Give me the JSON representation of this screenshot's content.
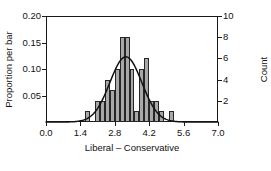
{
  "chart_data": {
    "type": "bar",
    "title": "",
    "subtitle": "",
    "xlabel": "Liberal – Conservative",
    "ylabel": "Proportion per bar",
    "ylabel_right": "Count",
    "xlim": [
      0.0,
      7.0
    ],
    "ylim": [
      0.0,
      0.2
    ],
    "ylim_right": [
      0,
      10
    ],
    "grid": false,
    "legend": null,
    "bin_width": 0.2,
    "n_total": 50,
    "x_ticks": [
      0.0,
      1.4,
      2.8,
      4.2,
      5.6,
      7.0
    ],
    "x_tick_labels": [
      "0.0",
      "1.4",
      "2.8",
      "4.2",
      "5.6",
      "7.0"
    ],
    "y_ticks_left": [
      0.05,
      0.1,
      0.15,
      0.2
    ],
    "y_tick_labels_left": [
      "0.05",
      "0.10",
      "0.15",
      "0.20"
    ],
    "y_ticks_right": [
      2,
      4,
      6,
      8,
      10
    ],
    "y_tick_labels_right": [
      "2",
      "4",
      "6",
      "8",
      "10"
    ],
    "bars": [
      {
        "x0": 1.6,
        "x1": 1.8,
        "count": 1,
        "proportion": 0.02
      },
      {
        "x0": 2.0,
        "x1": 2.2,
        "count": 2,
        "proportion": 0.04
      },
      {
        "x0": 2.2,
        "x1": 2.4,
        "count": 2,
        "proportion": 0.04
      },
      {
        "x0": 2.4,
        "x1": 2.6,
        "count": 4,
        "proportion": 0.08
      },
      {
        "x0": 2.6,
        "x1": 2.8,
        "count": 3,
        "proportion": 0.06
      },
      {
        "x0": 2.8,
        "x1": 3.0,
        "count": 5,
        "proportion": 0.1
      },
      {
        "x0": 3.0,
        "x1": 3.2,
        "count": 8,
        "proportion": 0.16
      },
      {
        "x0": 3.2,
        "x1": 3.4,
        "count": 8,
        "proportion": 0.16
      },
      {
        "x0": 3.4,
        "x1": 3.6,
        "count": 5,
        "proportion": 0.1
      },
      {
        "x0": 3.6,
        "x1": 3.8,
        "count": 1,
        "proportion": 0.02
      },
      {
        "x0": 3.8,
        "x1": 4.0,
        "count": 5,
        "proportion": 0.1
      },
      {
        "x0": 4.0,
        "x1": 4.2,
        "count": 6,
        "proportion": 0.12
      },
      {
        "x0": 4.2,
        "x1": 4.4,
        "count": 2,
        "proportion": 0.04
      },
      {
        "x0": 4.4,
        "x1": 4.6,
        "count": 2,
        "proportion": 0.04
      },
      {
        "x0": 4.6,
        "x1": 4.8,
        "count": 1,
        "proportion": 0.02
      },
      {
        "x0": 5.0,
        "x1": 5.2,
        "count": 1,
        "proportion": 0.02
      }
    ],
    "overlay_curve": {
      "name": "normal-density",
      "mean": 3.25,
      "sd": 0.65,
      "peak_proportion": 0.123,
      "peak_count": 6.15
    }
  }
}
